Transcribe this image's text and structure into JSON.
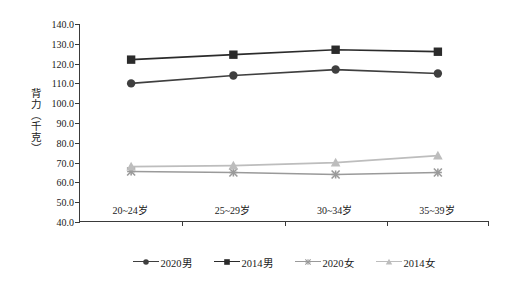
{
  "chart_data": {
    "type": "line",
    "title": "",
    "subtitle": "",
    "xlabel": "",
    "ylabel": "背力（千克）",
    "categories": [
      "20~24岁",
      "25~29岁",
      "30~34岁",
      "35~39岁"
    ],
    "ylim": [
      40.0,
      140.0
    ],
    "ytick_labels": [
      "140.0",
      "130.0",
      "120.0",
      "110.0",
      "100.0",
      "90.0",
      "80.0",
      "70.0",
      "60.0",
      "50.0",
      "40.0"
    ],
    "ytick_values": [
      140,
      130,
      120,
      110,
      100,
      90,
      80,
      70,
      60,
      50,
      40
    ],
    "grid": false,
    "legend_position": "bottom",
    "series": [
      {
        "name": "2020男",
        "marker": "circle",
        "color": "#3f3f3f",
        "values": [
          110.0,
          114.0,
          117.0,
          115.0
        ]
      },
      {
        "name": "2014男",
        "marker": "square",
        "color": "#2b2b2b",
        "values": [
          122.0,
          124.5,
          127.0,
          126.0
        ]
      },
      {
        "name": "2020女",
        "marker": "x",
        "color": "#9a9a9a",
        "values": [
          65.5,
          65.0,
          64.0,
          65.0
        ]
      },
      {
        "name": "2014女",
        "marker": "triangle",
        "color": "#bdbdbd",
        "values": [
          68.0,
          68.5,
          70.0,
          73.5
        ]
      }
    ]
  },
  "colors": {
    "axis": "#3a3a3a",
    "text": "#1a1a1a",
    "background": "#ffffff"
  }
}
